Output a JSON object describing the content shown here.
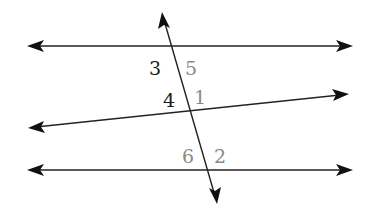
{
  "diagram": {
    "lines": [
      {
        "id": "top-line",
        "type": "line",
        "arrows": "both"
      },
      {
        "id": "middle-line",
        "type": "line",
        "arrows": "both"
      },
      {
        "id": "bottom-line",
        "type": "line",
        "arrows": "both"
      },
      {
        "id": "transversal",
        "type": "line",
        "arrows": "both"
      }
    ],
    "angle_labels": [
      {
        "label": "3",
        "color": "#1a1a1a"
      },
      {
        "label": "5",
        "color": "#8a8a8a"
      },
      {
        "label": "4",
        "color": "#1a1a1a"
      },
      {
        "label": "1",
        "color": "#8a8a8a"
      },
      {
        "label": "6",
        "color": "#8a8a8a"
      },
      {
        "label": "2",
        "color": "#8a8a8a"
      }
    ]
  }
}
